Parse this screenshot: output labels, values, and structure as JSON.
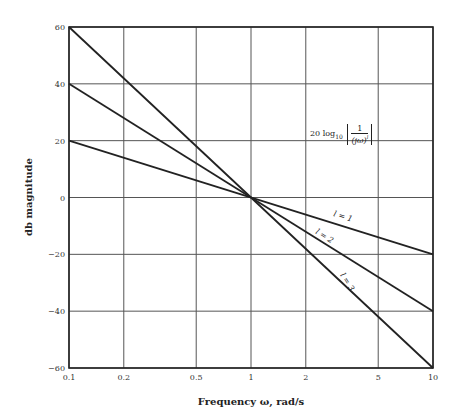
{
  "chart_data": {
    "type": "line",
    "title": "",
    "xlabel": "Frequency ω, rad/s",
    "ylabel": "db magnitude",
    "xscale": "log",
    "xlim": [
      0.1,
      10
    ],
    "ylim": [
      -60,
      60
    ],
    "grid": true,
    "x_ticks": [
      "0.1",
      "0.2",
      "0.5",
      "1",
      "2",
      "5",
      "10"
    ],
    "y_ticks": [
      "60",
      "40",
      "20",
      "0",
      "−20",
      "−40",
      "−60"
    ],
    "annotation": "20 log10 |1/(jω)^l|",
    "series": [
      {
        "name": "l = 1",
        "x": [
          0.1,
          10
        ],
        "values": [
          20,
          -20
        ]
      },
      {
        "name": "l = 2",
        "x": [
          0.1,
          10
        ],
        "values": [
          40,
          -40
        ]
      },
      {
        "name": "l = 3",
        "x": [
          0.1,
          10
        ],
        "values": [
          60,
          -60
        ]
      }
    ]
  },
  "labels": {
    "l1": "l = 1",
    "l2": "l = 2",
    "l3": "l = 3",
    "formula_prefix": "20 log",
    "formula_sub": "10",
    "formula_num": "1",
    "formula_den": "(jω)",
    "formula_exp": "l"
  }
}
